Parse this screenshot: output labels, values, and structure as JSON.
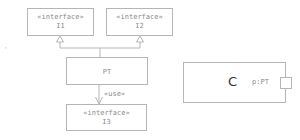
{
  "diagram": {
    "interfaces": [
      {
        "stereotype": "«interface»",
        "name": "I1"
      },
      {
        "stereotype": "«interface»",
        "name": "I2"
      },
      {
        "stereotype": "«interface»",
        "name": "I3"
      }
    ],
    "class_pt": {
      "name": "PT"
    },
    "use_label": "«use»",
    "component": {
      "name": "C",
      "port_label": "p:PT"
    },
    "stray_mark": ","
  },
  "colors": {
    "line": "#b5b5b5",
    "text": "#8a8a8a",
    "component_text": "#333333"
  }
}
